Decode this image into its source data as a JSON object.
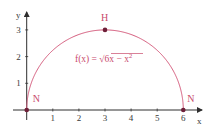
{
  "chart_data": {
    "type": "line",
    "title": "",
    "xlabel": "x",
    "ylabel": "y",
    "xlim": [
      0,
      6.5
    ],
    "ylim": [
      0,
      3.5
    ],
    "grid": false,
    "x_ticks": [
      1,
      2,
      3,
      4,
      5,
      6
    ],
    "y_ticks": [
      1,
      2,
      3
    ],
    "series": [
      {
        "name": "f(x) = √(6x − x²)",
        "function": "sqrt(6x - x^2)",
        "domain": [
          0,
          6
        ],
        "x": [
          0,
          0.25,
          0.5,
          1,
          1.5,
          2,
          2.5,
          3,
          3.5,
          4,
          4.5,
          5,
          5.5,
          5.75,
          6
        ],
        "values": [
          0,
          1.2,
          1.66,
          2.24,
          2.6,
          2.83,
          2.96,
          3.0,
          2.96,
          2.83,
          2.6,
          2.24,
          1.66,
          1.2,
          0
        ]
      }
    ],
    "annotations": [
      {
        "label": "N",
        "x": 0,
        "y": 0,
        "kind": "zero"
      },
      {
        "label": "H",
        "x": 3,
        "y": 3,
        "kind": "maximum"
      },
      {
        "label": "N",
        "x": 6,
        "y": 0,
        "kind": "zero"
      }
    ],
    "formula_label": {
      "prefix": "f(x) = ",
      "radical": "√",
      "radicand": "6x − x",
      "exponent": "2"
    }
  },
  "colors": {
    "curve": "#d4587a",
    "label": "#c94a6c",
    "point": "#6e1f38",
    "axis": "#2e2e2e",
    "tick_text": "#3a3a3a"
  }
}
